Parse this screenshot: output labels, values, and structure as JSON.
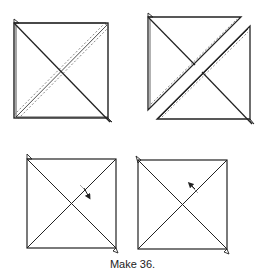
{
  "figure": {
    "caption": "Make 36.",
    "line_color": "#222222",
    "stitch_color": "#555555",
    "panels": [
      {
        "id": "top-left",
        "description": "Two squares layered right sides together with diagonal stitching lines on both sides of one diagonal"
      },
      {
        "id": "top-right",
        "description": "Layered squares cut apart along the diagonal between stitching lines into two pieces"
      },
      {
        "id": "bottom-left",
        "description": "Hourglass unit with seam pressed in one direction (arrow)"
      },
      {
        "id": "bottom-right",
        "description": "Hourglass unit with seam pressed in the opposite direction (arrow)"
      }
    ]
  }
}
